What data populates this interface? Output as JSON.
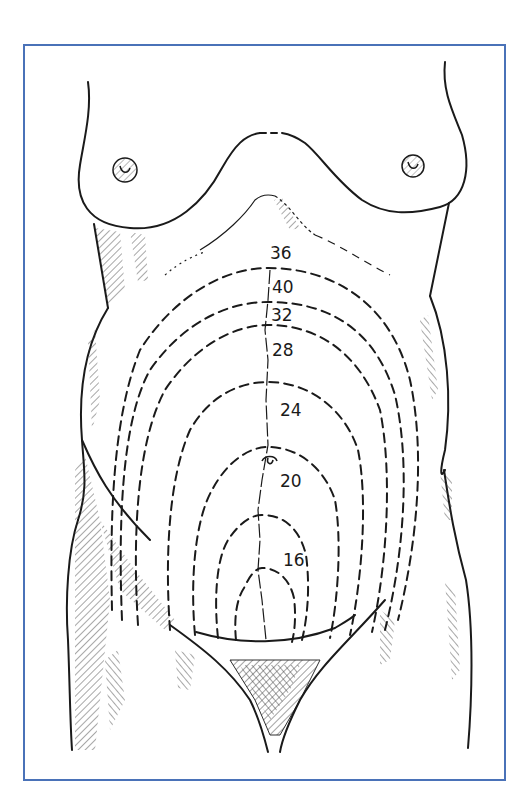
{
  "figure": {
    "frame_color": "#4a72b8",
    "line_color": "#1a1a1a"
  },
  "labels": [
    {
      "text": "36",
      "x": 270,
      "y": 245
    },
    {
      "text": "40",
      "x": 272,
      "y": 279
    },
    {
      "text": "32",
      "x": 271,
      "y": 307
    },
    {
      "text": "28",
      "x": 272,
      "y": 342
    },
    {
      "text": "24",
      "x": 280,
      "y": 402
    },
    {
      "text": "20",
      "x": 280,
      "y": 473
    },
    {
      "text": "16",
      "x": 283,
      "y": 552
    }
  ],
  "fundal_contours": [
    {
      "id": "arc-36",
      "top_y": 268,
      "left_x": 110,
      "right_x": 418
    },
    {
      "id": "arc-40",
      "top_y": 302,
      "left_x": 118,
      "right_x": 405
    },
    {
      "id": "arc-32",
      "top_y": 325,
      "left_x": 128,
      "right_x": 395
    },
    {
      "id": "arc-28",
      "top_y": 382,
      "left_x": 168,
      "right_x": 378
    },
    {
      "id": "arc-24",
      "top_y": 447,
      "left_x": 188,
      "right_x": 355
    },
    {
      "id": "arc-20",
      "top_y": 515,
      "left_x": 215,
      "right_x": 322
    },
    {
      "id": "arc-16",
      "top_y": 568,
      "left_x": 232,
      "right_x": 300
    }
  ]
}
